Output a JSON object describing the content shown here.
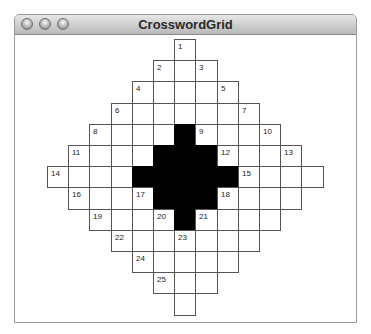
{
  "window": {
    "title": "CrosswordGrid",
    "buttons": [
      "close",
      "minimize",
      "zoom"
    ]
  },
  "grid": {
    "size": 13,
    "shape": "diamond",
    "black_cells": [
      [
        4,
        6
      ],
      [
        5,
        5
      ],
      [
        5,
        6
      ],
      [
        5,
        7
      ],
      [
        6,
        4
      ],
      [
        6,
        5
      ],
      [
        6,
        6
      ],
      [
        6,
        7
      ],
      [
        6,
        8
      ],
      [
        7,
        5
      ],
      [
        7,
        6
      ],
      [
        7,
        7
      ],
      [
        8,
        6
      ]
    ],
    "numbers": [
      {
        "n": "1",
        "r": 0,
        "c": 6
      },
      {
        "n": "2",
        "r": 1,
        "c": 5
      },
      {
        "n": "3",
        "r": 1,
        "c": 7
      },
      {
        "n": "4",
        "r": 2,
        "c": 4
      },
      {
        "n": "5",
        "r": 2,
        "c": 8
      },
      {
        "n": "6",
        "r": 3,
        "c": 3
      },
      {
        "n": "7",
        "r": 3,
        "c": 9
      },
      {
        "n": "8",
        "r": 4,
        "c": 2
      },
      {
        "n": "9",
        "r": 4,
        "c": 7
      },
      {
        "n": "10",
        "r": 4,
        "c": 10
      },
      {
        "n": "11",
        "r": 5,
        "c": 1
      },
      {
        "n": "12",
        "r": 5,
        "c": 8
      },
      {
        "n": "13",
        "r": 5,
        "c": 11
      },
      {
        "n": "14",
        "r": 6,
        "c": 0
      },
      {
        "n": "15",
        "r": 6,
        "c": 9
      },
      {
        "n": "16",
        "r": 7,
        "c": 1
      },
      {
        "n": "17",
        "r": 7,
        "c": 4
      },
      {
        "n": "18",
        "r": 7,
        "c": 8
      },
      {
        "n": "19",
        "r": 8,
        "c": 2
      },
      {
        "n": "20",
        "r": 8,
        "c": 5
      },
      {
        "n": "21",
        "r": 8,
        "c": 7
      },
      {
        "n": "22",
        "r": 9,
        "c": 3
      },
      {
        "n": "23",
        "r": 9,
        "c": 6
      },
      {
        "n": "24",
        "r": 10,
        "c": 4
      },
      {
        "n": "25",
        "r": 11,
        "c": 5
      }
    ]
  }
}
